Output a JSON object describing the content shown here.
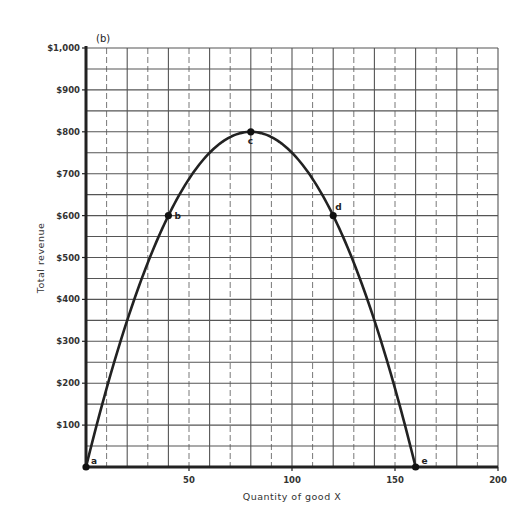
{
  "chart_data": {
    "type": "line",
    "title": "",
    "panel_label": "(b)",
    "xlabel": "Quantity of good X",
    "ylabel": "Total revenue",
    "xlim": [
      0,
      200
    ],
    "ylim": [
      0,
      1000
    ],
    "x_ticks": [
      50,
      100,
      150,
      200
    ],
    "x_tick_labels": [
      "50",
      "100",
      "150",
      "200"
    ],
    "y_ticks": [
      100,
      200,
      300,
      400,
      500,
      600,
      700,
      800,
      900,
      1000
    ],
    "y_tick_labels": [
      "$100",
      "$200",
      "$300",
      "$400",
      "$500",
      "$600",
      "$700",
      "$800",
      "$900",
      "$1,000"
    ],
    "grid": {
      "on": true,
      "x_step": 10,
      "y_step": 50
    },
    "series": [
      {
        "name": "Total revenue",
        "x": [
          0,
          10,
          20,
          30,
          40,
          50,
          60,
          70,
          80,
          90,
          100,
          110,
          120,
          130,
          140,
          150,
          160
        ],
        "values": [
          0,
          190,
          350,
          490,
          600,
          690,
          750,
          790,
          800,
          790,
          750,
          690,
          600,
          490,
          350,
          190,
          0
        ]
      }
    ],
    "points": [
      {
        "label": "a",
        "x": 0,
        "y": 0
      },
      {
        "label": "b",
        "x": 40,
        "y": 600
      },
      {
        "label": "c",
        "x": 80,
        "y": 800
      },
      {
        "label": "d",
        "x": 120,
        "y": 600
      },
      {
        "label": "e",
        "x": 160,
        "y": 0
      }
    ],
    "colors": {
      "line": "#222222",
      "grid": "#555555",
      "axis": "#222222"
    }
  }
}
